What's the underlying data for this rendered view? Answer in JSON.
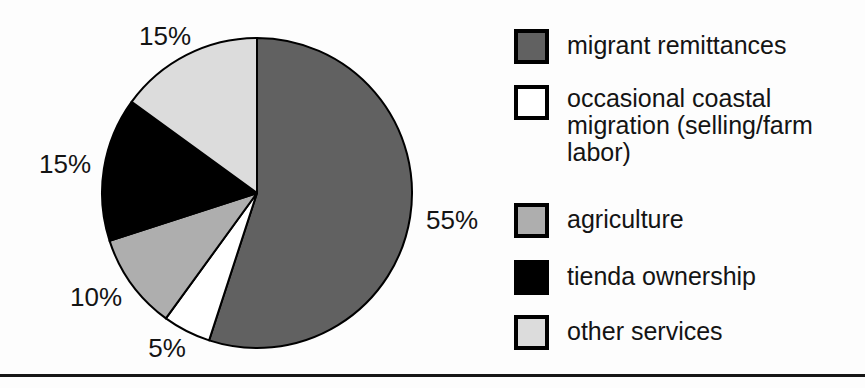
{
  "chart_data": {
    "type": "pie",
    "title": "",
    "legend_position": "right",
    "start_angle_deg": 0,
    "direction": "clockwise",
    "outline_color": "#000000",
    "slices": [
      {
        "label": "migrant remittances",
        "value": 55,
        "percent_label": "55%",
        "color": "#616161"
      },
      {
        "label": "occasional coastal migration (selling/farm labor)",
        "value": 5,
        "percent_label": "5%",
        "color": "#ffffff"
      },
      {
        "label": "agriculture",
        "value": 10,
        "percent_label": "10%",
        "color": "#aeaeae"
      },
      {
        "label": "tienda ownership",
        "value": 15,
        "percent_label": "15%",
        "color": "#000000"
      },
      {
        "label": "other services",
        "value": 15,
        "percent_label": "15%",
        "color": "#dcdcdc"
      }
    ]
  },
  "page": {
    "bottom_rule_color": "#161616"
  }
}
